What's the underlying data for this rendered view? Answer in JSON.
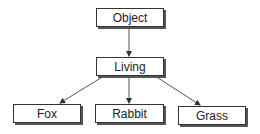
{
  "diagram": {
    "type": "hierarchy",
    "nodes": [
      {
        "id": "object",
        "label": "Object"
      },
      {
        "id": "living",
        "label": "Living"
      },
      {
        "id": "fox",
        "label": "Fox"
      },
      {
        "id": "rabbit",
        "label": "Rabbit"
      },
      {
        "id": "grass",
        "label": "Grass"
      }
    ],
    "edges": [
      {
        "from": "object",
        "to": "living"
      },
      {
        "from": "living",
        "to": "fox"
      },
      {
        "from": "living",
        "to": "rabbit"
      },
      {
        "from": "living",
        "to": "grass"
      }
    ],
    "colors": {
      "line": "#555555",
      "border": "#333333",
      "text": "#222222"
    }
  }
}
